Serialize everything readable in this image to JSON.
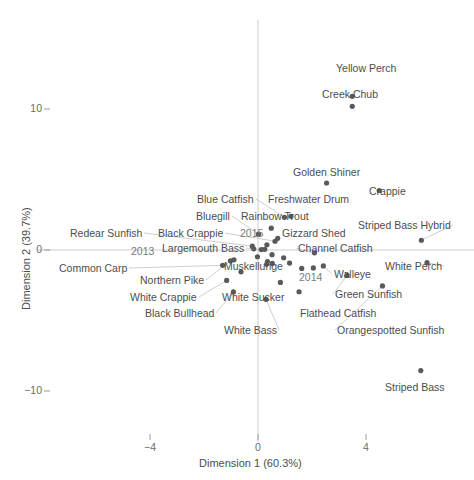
{
  "chart_data": {
    "type": "scatter",
    "title": "",
    "xlabel": "Dimension 1 (60.3%)",
    "ylabel": "Dimension 2 (39.7%)",
    "xlim": [
      -6.2,
      7.1
    ],
    "ylim": [
      -13.5,
      14.2
    ],
    "xticks": [
      -4,
      0,
      4
    ],
    "xtick_labels": [
      "−4",
      "0",
      "4"
    ],
    "yticks": [
      10,
      0,
      -10
    ],
    "ytick_labels": [
      "10",
      "0",
      "−10"
    ],
    "grid": false,
    "legend": "none",
    "axis_lines": {
      "vertical_at_x": 0,
      "horizontal_at_y": 0,
      "color": "#cccccc"
    },
    "point_color": "#595959",
    "point_radius_px": 2.6,
    "leader_line_color": "#c8c8c8",
    "species": [
      {
        "name": "Yellow Perch",
        "x": 3.49,
        "y": 10.9,
        "lx": 336,
        "ly": 63,
        "anchor": "start",
        "leader": false
      },
      {
        "name": "Creek Chub",
        "x": 3.49,
        "y": 10.19,
        "lx": 322,
        "ly": 89,
        "anchor": "start",
        "leader": false
      },
      {
        "name": "Golden Shiner",
        "x": 2.54,
        "y": 4.75,
        "lx": 293,
        "ly": 167,
        "anchor": "start",
        "leader": false
      },
      {
        "name": "Crappie",
        "x": 4.49,
        "y": 4.22,
        "lx": 369,
        "ly": 186,
        "anchor": "start",
        "leader": false
      },
      {
        "name": "Freshwater Drum",
        "x": 1.22,
        "y": 2.39,
        "lx": 268,
        "ly": 194,
        "anchor": "start",
        "leader": false
      },
      {
        "name": "Blue Catfish",
        "x": 0.98,
        "y": 2.32,
        "lx": 197,
        "ly": 194,
        "anchor": "start",
        "leader": true
      },
      {
        "name": "Rainbow Trout",
        "x": 0.49,
        "y": 1.55,
        "lx": 241,
        "ly": 211,
        "anchor": "start",
        "leader": false
      },
      {
        "name": "Bluegill",
        "x": 0.02,
        "y": 1.12,
        "lx": 196,
        "ly": 211,
        "anchor": "start",
        "leader": true
      },
      {
        "name": "Gizzard Shed",
        "x": 0.73,
        "y": 0.83,
        "lx": 282,
        "ly": 228,
        "anchor": "start",
        "leader": false
      },
      {
        "name": "Striped Bass Hybrid",
        "x": 6.05,
        "y": 0.69,
        "lx": 358,
        "ly": 220,
        "anchor": "start",
        "leader": true
      },
      {
        "name": "Black Crappie",
        "x": 0.63,
        "y": 0.62,
        "lx": 158,
        "ly": 228,
        "anchor": "start",
        "leader": true
      },
      {
        "name": "Redear Sunfish",
        "x": -0.21,
        "y": 0.27,
        "lx": 70,
        "ly": 228,
        "anchor": "start",
        "leader": true
      },
      {
        "name": "Largemouth Bass",
        "x": 0.12,
        "y": 0.03,
        "lx": 162,
        "ly": 243,
        "anchor": "start",
        "leader": true
      },
      {
        "name": "Channel Catfish",
        "x": 2.09,
        "y": -0.2,
        "lx": 298,
        "ly": 243,
        "anchor": "start",
        "leader": true
      },
      {
        "name": "Muskellunge",
        "x": 0.35,
        "y": -0.82,
        "lx": 224,
        "ly": 261,
        "anchor": "start",
        "leader": false
      },
      {
        "name": "White Perch",
        "x": 6.26,
        "y": -0.9,
        "lx": 385,
        "ly": 261,
        "anchor": "start",
        "leader": true
      },
      {
        "name": "Walleye",
        "x": 2.42,
        "y": -1.13,
        "lx": 334,
        "ly": 269,
        "anchor": "start",
        "leader": true
      },
      {
        "name": "Common Carp",
        "x": -1.31,
        "y": -1.09,
        "lx": 59,
        "ly": 263,
        "anchor": "start",
        "leader": true
      },
      {
        "name": "Northern Pike",
        "x": -1.02,
        "y": -0.77,
        "lx": 140,
        "ly": 275,
        "anchor": "start",
        "leader": true
      },
      {
        "name": "Green Sunfish",
        "x": 3.3,
        "y": -1.8,
        "lx": 335,
        "ly": 289,
        "anchor": "start",
        "leader": true
      },
      {
        "name": "White Crappie",
        "x": -1.16,
        "y": -2.16,
        "lx": 130,
        "ly": 292,
        "anchor": "start",
        "leader": true
      },
      {
        "name": "White Sucker",
        "x": 0.83,
        "y": -2.3,
        "lx": 222,
        "ly": 292,
        "anchor": "start",
        "leader": false
      },
      {
        "name": "Black Bullhead",
        "x": -0.91,
        "y": -2.97,
        "lx": 145,
        "ly": 308,
        "anchor": "start",
        "leader": true
      },
      {
        "name": "Flathead Catfish",
        "x": 1.52,
        "y": -2.96,
        "lx": 300,
        "ly": 308,
        "anchor": "start",
        "leader": false
      },
      {
        "name": "Orangespotted Sunfish",
        "x": 4.61,
        "y": -2.55,
        "lx": 337,
        "ly": 325,
        "anchor": "start",
        "leader": true
      },
      {
        "name": "White Bass",
        "x": 0.3,
        "y": -3.5,
        "lx": 224,
        "ly": 325,
        "anchor": "start",
        "leader": true
      },
      {
        "name": "Striped Bass",
        "x": 6.03,
        "y": -8.55,
        "lx": 385,
        "ly": 382,
        "anchor": "start",
        "leader": false
      }
    ],
    "extra_points": [
      {
        "x": -0.16,
        "y": 0.08
      },
      {
        "x": 0.25,
        "y": 0.05
      },
      {
        "x": 0.52,
        "y": -0.33
      },
      {
        "x": 0.95,
        "y": -0.55
      },
      {
        "x": 1.17,
        "y": -0.93
      },
      {
        "x": -0.02,
        "y": -0.48
      },
      {
        "x": 0.32,
        "y": -1.01
      },
      {
        "x": 1.62,
        "y": -1.31
      },
      {
        "x": -0.63,
        "y": -1.55
      },
      {
        "x": 0.53,
        "y": -0.95
      }
    ],
    "year_labels": [
      {
        "name": "2013",
        "lx": 131,
        "ly": 246,
        "px": -0.89,
        "py": -0.7
      },
      {
        "name": "2015",
        "lx": 240,
        "ly": 228,
        "px": 0.33,
        "py": 0.37
      },
      {
        "name": "2014",
        "lx": 299,
        "ly": 272,
        "px": 2.05,
        "py": -1.27
      }
    ]
  }
}
